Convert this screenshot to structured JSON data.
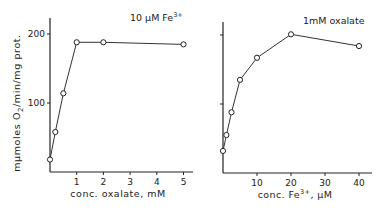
{
  "chart_data": [
    {
      "type": "line",
      "title": "10 µM Fe3+",
      "annotation": "10 µM Fe³⁺",
      "xlabel": "conc. oxalate, mM",
      "ylabel": "mµmoles O2/min/mg prot.",
      "x": [
        0,
        0.2,
        0.5,
        1,
        2,
        5
      ],
      "values": [
        18,
        58,
        114,
        188,
        188,
        185
      ],
      "xticks": [
        "1",
        "2",
        "3",
        "4",
        "5"
      ],
      "xtick_values": [
        1,
        2,
        3,
        4,
        5
      ],
      "yticks": [
        "100",
        "200"
      ],
      "ytick_values": [
        100,
        200
      ],
      "xlim": [
        0,
        5.4
      ],
      "ylim": [
        0,
        220
      ],
      "grid": false,
      "marker": "open-circle"
    },
    {
      "type": "line",
      "title": "1 mM oxalate",
      "annotation": "1mM oxalate",
      "xlabel": "conc. Fe3+, µM",
      "ylabel": "mµmoles O2/min/mg prot.",
      "x": [
        0,
        1,
        2.5,
        5,
        10,
        20,
        40
      ],
      "values": [
        32,
        55,
        88,
        135,
        167,
        201,
        184
      ],
      "xticks": [
        "10",
        "20",
        "30",
        "40"
      ],
      "xtick_values": [
        10,
        20,
        30,
        40
      ],
      "yticks": [
        "",
        ""
      ],
      "ytick_values": [
        100,
        200
      ],
      "xlim": [
        0,
        43
      ],
      "ylim": [
        0,
        220
      ],
      "grid": false,
      "marker": "open-circle"
    }
  ],
  "labels": {
    "left_annotation_main": "10 µM Fe",
    "left_annotation_sup": "3+",
    "left_xlabel": "conc. oxalate, mM",
    "ylabel_pre": "mµmoles O",
    "ylabel_sub": "2",
    "ylabel_post": "/min/mg prot.",
    "right_annotation": "1mM oxalate",
    "right_xlabel_pre": "conc. Fe",
    "right_xlabel_sup": "3+",
    "right_xlabel_post": ", µM"
  }
}
